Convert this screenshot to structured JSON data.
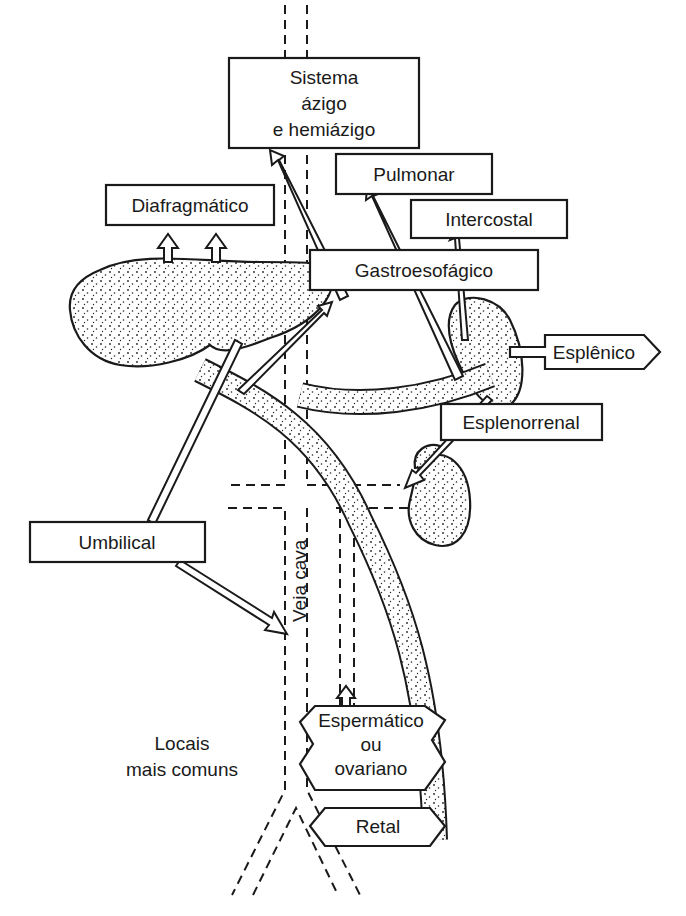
{
  "diagram": {
    "type": "anatomical-flow",
    "labels": {
      "azygos_line1": "Sistema",
      "azygos_line2": "ázigo",
      "azygos_line3": "e hemiázigo",
      "pulmonary": "Pulmonar",
      "diaphragmatic": "Diafragmático",
      "intercostal": "Intercostal",
      "gastroesophageal": "Gastroesofágico",
      "splenic": "Esplênico",
      "splenorenal": "Esplenorrenal",
      "umbilical": "Umbilical",
      "vena_cava": "Veia cava",
      "spermatic_line1": "Espermático",
      "spermatic_line2": "ou",
      "spermatic_line3": "ovariano",
      "rectal": "Retal",
      "legend_line1": "Locais",
      "legend_line2": "mais comuns"
    },
    "colors": {
      "ink": "#1a1a1a",
      "background": "#ffffff"
    }
  }
}
